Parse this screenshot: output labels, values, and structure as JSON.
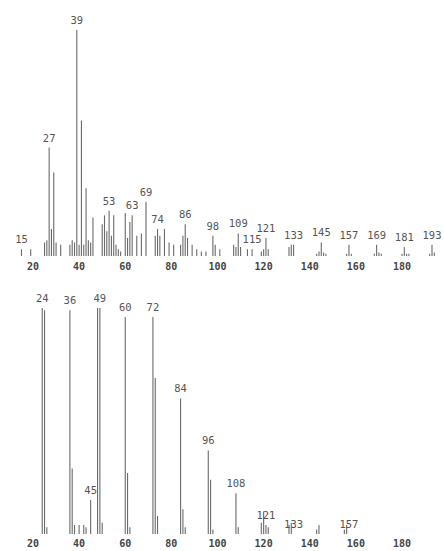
{
  "chart_data": [
    {
      "type": "bar",
      "subtype": "mass-spectrum",
      "title": "",
      "xlabel": "",
      "ylabel": "",
      "xlim": [
        10,
        200
      ],
      "ylim": [
        0,
        100
      ],
      "grid": false,
      "x_ticks": [
        20,
        40,
        60,
        80,
        100,
        120,
        140,
        160,
        180
      ],
      "x_tick_labels": [
        "20",
        "40",
        "60",
        "80",
        "100",
        "120",
        "140",
        "160",
        "180"
      ],
      "peak_labels": [
        {
          "x": 15,
          "text": "15"
        },
        {
          "x": 27,
          "text": "27"
        },
        {
          "x": 39,
          "text": "39"
        },
        {
          "x": 53,
          "text": "53"
        },
        {
          "x": 63,
          "text": "63"
        },
        {
          "x": 69,
          "text": "69"
        },
        {
          "x": 74,
          "text": "74"
        },
        {
          "x": 86,
          "text": "86"
        },
        {
          "x": 98,
          "text": "98"
        },
        {
          "x": 109,
          "text": "109"
        },
        {
          "x": 115,
          "text": "115"
        },
        {
          "x": 121,
          "text": "121"
        },
        {
          "x": 133,
          "text": "133"
        },
        {
          "x": 145,
          "text": "145"
        },
        {
          "x": 157,
          "text": "157"
        },
        {
          "x": 169,
          "text": "169"
        },
        {
          "x": 181,
          "text": "181"
        },
        {
          "x": 193,
          "text": "193"
        }
      ],
      "peaks": [
        {
          "x": 15,
          "y": 3
        },
        {
          "x": 19,
          "y": 3
        },
        {
          "x": 25,
          "y": 6
        },
        {
          "x": 26,
          "y": 7
        },
        {
          "x": 27,
          "y": 48
        },
        {
          "x": 28,
          "y": 12
        },
        {
          "x": 29,
          "y": 37
        },
        {
          "x": 30,
          "y": 6
        },
        {
          "x": 32,
          "y": 5
        },
        {
          "x": 36,
          "y": 5
        },
        {
          "x": 37,
          "y": 7
        },
        {
          "x": 38,
          "y": 6
        },
        {
          "x": 39,
          "y": 100
        },
        {
          "x": 40,
          "y": 5
        },
        {
          "x": 41,
          "y": 60
        },
        {
          "x": 42,
          "y": 5
        },
        {
          "x": 43,
          "y": 30
        },
        {
          "x": 44,
          "y": 7
        },
        {
          "x": 45,
          "y": 6
        },
        {
          "x": 46,
          "y": 17
        },
        {
          "x": 50,
          "y": 14
        },
        {
          "x": 51,
          "y": 18
        },
        {
          "x": 52,
          "y": 11
        },
        {
          "x": 53,
          "y": 20
        },
        {
          "x": 54,
          "y": 9
        },
        {
          "x": 55,
          "y": 18
        },
        {
          "x": 56,
          "y": 5
        },
        {
          "x": 57,
          "y": 3
        },
        {
          "x": 58,
          "y": 2
        },
        {
          "x": 60,
          "y": 19
        },
        {
          "x": 61,
          "y": 8
        },
        {
          "x": 62,
          "y": 15
        },
        {
          "x": 63,
          "y": 18
        },
        {
          "x": 65,
          "y": 9
        },
        {
          "x": 67,
          "y": 10
        },
        {
          "x": 69,
          "y": 24
        },
        {
          "x": 73,
          "y": 9
        },
        {
          "x": 74,
          "y": 12
        },
        {
          "x": 75,
          "y": 9
        },
        {
          "x": 77,
          "y": 12
        },
        {
          "x": 79,
          "y": 6
        },
        {
          "x": 81,
          "y": 5
        },
        {
          "x": 84,
          "y": 5
        },
        {
          "x": 85,
          "y": 9
        },
        {
          "x": 86,
          "y": 14
        },
        {
          "x": 87,
          "y": 8
        },
        {
          "x": 89,
          "y": 5
        },
        {
          "x": 91,
          "y": 3
        },
        {
          "x": 93,
          "y": 2
        },
        {
          "x": 95,
          "y": 2
        },
        {
          "x": 98,
          "y": 9
        },
        {
          "x": 99,
          "y": 5
        },
        {
          "x": 101,
          "y": 3
        },
        {
          "x": 107,
          "y": 5
        },
        {
          "x": 108,
          "y": 4
        },
        {
          "x": 109,
          "y": 10
        },
        {
          "x": 110,
          "y": 4
        },
        {
          "x": 113,
          "y": 3
        },
        {
          "x": 115,
          "y": 3
        },
        {
          "x": 119,
          "y": 2
        },
        {
          "x": 120,
          "y": 3
        },
        {
          "x": 121,
          "y": 8
        },
        {
          "x": 122,
          "y": 3
        },
        {
          "x": 131,
          "y": 4
        },
        {
          "x": 132,
          "y": 5
        },
        {
          "x": 133,
          "y": 5
        },
        {
          "x": 143,
          "y": 1
        },
        {
          "x": 144,
          "y": 2
        },
        {
          "x": 145,
          "y": 6
        },
        {
          "x": 146,
          "y": 1.5
        },
        {
          "x": 147,
          "y": 1
        },
        {
          "x": 156,
          "y": 1
        },
        {
          "x": 157,
          "y": 5
        },
        {
          "x": 158,
          "y": 1
        },
        {
          "x": 168,
          "y": 1
        },
        {
          "x": 169,
          "y": 5
        },
        {
          "x": 170,
          "y": 1.5
        },
        {
          "x": 171,
          "y": 1
        },
        {
          "x": 180,
          "y": 1
        },
        {
          "x": 181,
          "y": 4
        },
        {
          "x": 182,
          "y": 1
        },
        {
          "x": 183,
          "y": 1
        },
        {
          "x": 192,
          "y": 1
        },
        {
          "x": 193,
          "y": 5
        },
        {
          "x": 194,
          "y": 1.5
        }
      ]
    },
    {
      "type": "bar",
      "subtype": "mass-spectrum",
      "title": "",
      "xlabel": "",
      "ylabel": "",
      "xlim": [
        10,
        200
      ],
      "ylim": [
        0,
        100
      ],
      "grid": false,
      "x_ticks": [
        20,
        40,
        60,
        80,
        100,
        120,
        140,
        160,
        180
      ],
      "x_tick_labels": [
        "20",
        "40",
        "60",
        "80",
        "100",
        "120",
        "140",
        "160",
        "180"
      ],
      "tick_label_colors": {
        "180": "#b05050"
      },
      "peak_labels": [
        {
          "x": 24,
          "text": "24"
        },
        {
          "x": 36,
          "text": "36"
        },
        {
          "x": 45,
          "text": "45"
        },
        {
          "x": 49,
          "text": "49"
        },
        {
          "x": 60,
          "text": "60"
        },
        {
          "x": 72,
          "text": "72"
        },
        {
          "x": 84,
          "text": "84"
        },
        {
          "x": 96,
          "text": "96"
        },
        {
          "x": 108,
          "text": "108"
        },
        {
          "x": 121,
          "text": "121"
        },
        {
          "x": 133,
          "text": "133"
        },
        {
          "x": 157,
          "text": "157"
        }
      ],
      "peaks": [
        {
          "x": 24,
          "y": 100
        },
        {
          "x": 25,
          "y": 99
        },
        {
          "x": 26,
          "y": 3
        },
        {
          "x": 36,
          "y": 99
        },
        {
          "x": 37,
          "y": 29
        },
        {
          "x": 38,
          "y": 4
        },
        {
          "x": 40,
          "y": 4
        },
        {
          "x": 42,
          "y": 4
        },
        {
          "x": 43,
          "y": 3
        },
        {
          "x": 45,
          "y": 15
        },
        {
          "x": 48,
          "y": 100
        },
        {
          "x": 49,
          "y": 100
        },
        {
          "x": 50,
          "y": 5
        },
        {
          "x": 60,
          "y": 96
        },
        {
          "x": 61,
          "y": 27
        },
        {
          "x": 62,
          "y": 3
        },
        {
          "x": 72,
          "y": 96
        },
        {
          "x": 73,
          "y": 69
        },
        {
          "x": 74,
          "y": 8
        },
        {
          "x": 84,
          "y": 60
        },
        {
          "x": 85,
          "y": 11
        },
        {
          "x": 86,
          "y": 3
        },
        {
          "x": 96,
          "y": 37
        },
        {
          "x": 97,
          "y": 24
        },
        {
          "x": 98,
          "y": 2
        },
        {
          "x": 108,
          "y": 18
        },
        {
          "x": 109,
          "y": 3
        },
        {
          "x": 119,
          "y": 5
        },
        {
          "x": 120,
          "y": 10
        },
        {
          "x": 121,
          "y": 4
        },
        {
          "x": 122,
          "y": 3
        },
        {
          "x": 131,
          "y": 4
        },
        {
          "x": 132,
          "y": 5
        },
        {
          "x": 143,
          "y": 2
        },
        {
          "x": 144,
          "y": 4
        },
        {
          "x": 155,
          "y": 2
        },
        {
          "x": 156,
          "y": 4
        }
      ]
    }
  ]
}
